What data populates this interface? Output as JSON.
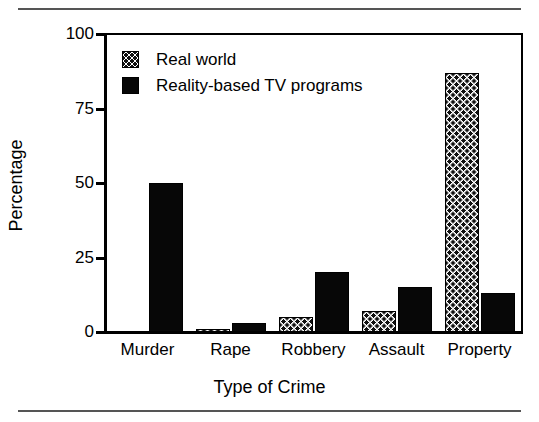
{
  "chart_data": {
    "type": "bar",
    "title": "",
    "xlabel": "Type of Crime",
    "ylabel": "Percentage",
    "categories": [
      "Murder",
      "Rape",
      "Robbery",
      "Assault",
      "Property"
    ],
    "series": [
      {
        "name": "Real world",
        "pattern": "dotted",
        "values": [
          0,
          1,
          5,
          7,
          87
        ]
      },
      {
        "name": "Reality-based TV programs",
        "pattern": "solid",
        "values": [
          50,
          3,
          20,
          15,
          13
        ]
      }
    ],
    "ylim": [
      0,
      100
    ],
    "yticks": [
      0,
      25,
      50,
      75,
      100
    ],
    "ytick_labels": [
      "0",
      "25",
      "50",
      "75",
      "100"
    ],
    "grid": false,
    "legend_position": "top-left",
    "colors": {
      "solid": "#070707",
      "dotted_fill": "#ffffff",
      "dot": "#111111",
      "axis": "#000000",
      "rule": "#555555"
    }
  },
  "legend": {
    "entries": [
      {
        "label": "Real world",
        "swatch": "dotted"
      },
      {
        "label": "Reality-based TV programs",
        "swatch": "solid"
      }
    ]
  }
}
